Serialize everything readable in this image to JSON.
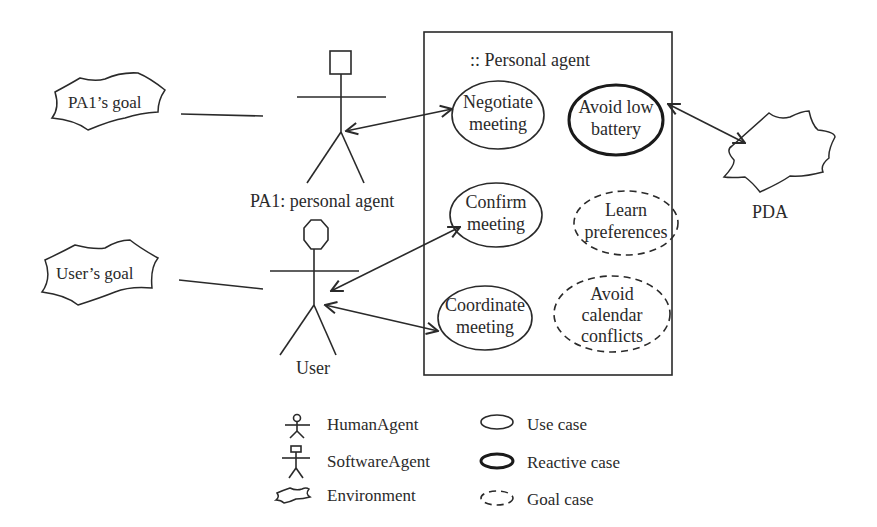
{
  "diagram": {
    "system_boundary": {
      "label": ":: Personal agent"
    },
    "actors": {
      "pa1": {
        "label": "PA1: personal agent",
        "kind": "SoftwareAgent"
      },
      "user": {
        "label": "User",
        "kind": "HumanAgent"
      }
    },
    "goals": {
      "pa1_goal": "PA1’s goal",
      "user_goal": "User’s goal"
    },
    "environment": {
      "pda": "PDA"
    },
    "use_cases": {
      "negotiate": [
        "Negotiate",
        "meeting"
      ],
      "avoid_battery": [
        "Avoid low",
        "battery"
      ],
      "confirm": [
        "Confirm",
        "meeting"
      ],
      "learn": [
        "Learn",
        "preferences"
      ],
      "coordinate": [
        "Coordinate",
        "meeting"
      ],
      "avoid_conflicts": [
        "Avoid",
        "calendar",
        "conflicts"
      ]
    },
    "use_case_types": {
      "negotiate": "Use case",
      "avoid_battery": "Reactive case",
      "confirm": "Use case",
      "learn": "Goal case",
      "coordinate": "Use case",
      "avoid_conflicts": "Goal case"
    },
    "legend": {
      "human_agent": "HumanAgent",
      "software_agent": "SoftwareAgent",
      "environment": "Environment",
      "use_case": "Use case",
      "reactive_case": "Reactive case",
      "goal_case": "Goal case"
    }
  }
}
